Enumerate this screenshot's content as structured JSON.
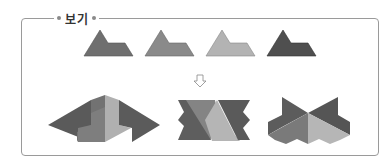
{
  "box": {
    "label": "보기"
  },
  "pieces": {
    "count": 4,
    "colors": [
      "#6f6f6f",
      "#8a8a8a",
      "#b3b3b3",
      "#4f4f4f"
    ]
  },
  "arrow": {
    "glyph": "⇩"
  },
  "arrangements": {
    "count": 3
  }
}
